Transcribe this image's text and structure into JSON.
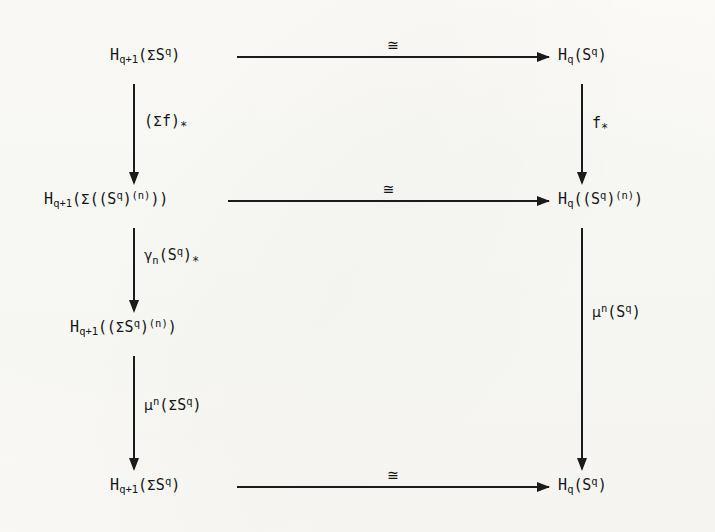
{
  "diagram": {
    "kind": "commutative-diagram",
    "title": "",
    "ink_color": "#1b1b1b",
    "paper_color": "#fbfaf7",
    "nodes": [
      {
        "id": "n-top-left",
        "name": "node-top-left",
        "text": "H_{q+1}(ΣS^q)",
        "base": "H",
        "subscript": "q+1",
        "argument": "(ΣS^q)",
        "row": 1,
        "col": "left"
      },
      {
        "id": "n-top-right",
        "name": "node-top-right",
        "text": "H_q(S^q)",
        "base": "H",
        "subscript": "q",
        "argument": "(S^q)",
        "row": 1,
        "col": "right"
      },
      {
        "id": "n-row2-left",
        "name": "node-row2-left",
        "text": "H_{q+1}(Σ((S^q)^(n)))",
        "base": "H",
        "subscript": "q+1",
        "argument": "(Σ((S^q)^(n)))",
        "row": 2,
        "col": "left"
      },
      {
        "id": "n-row2-right",
        "name": "node-row2-right",
        "text": "H_q((S^q)^(n))",
        "base": "H",
        "subscript": "q",
        "argument": "((S^q)^(n))",
        "row": 2,
        "col": "right"
      },
      {
        "id": "n-row3-left",
        "name": "node-row3-left",
        "text": "H_{q+1}((ΣS^q)^(n))",
        "base": "H",
        "subscript": "q+1",
        "argument": "((ΣS^q)^(n))",
        "row": 3,
        "col": "left"
      },
      {
        "id": "n-bottom-left",
        "name": "node-bottom-left",
        "text": "H_{q+1}(ΣS^q)",
        "base": "H",
        "subscript": "q+1",
        "argument": "(ΣS^q)",
        "row": 4,
        "col": "left"
      },
      {
        "id": "n-bottom-right",
        "name": "node-bottom-right",
        "text": "H_q(S^q)",
        "base": "H",
        "subscript": "q",
        "argument": "(S^q)",
        "row": 4,
        "col": "right"
      }
    ],
    "horizontal_arrows": [
      {
        "id": "h1",
        "name": "arrow-top-horizontal",
        "label": "≅",
        "from": "n-top-left",
        "to": "n-top-right",
        "direction": "right"
      },
      {
        "id": "h2",
        "name": "arrow-middle-horizontal",
        "label": "≅",
        "from": "n-row2-left",
        "to": "n-row2-right",
        "direction": "right"
      },
      {
        "id": "h3",
        "name": "arrow-bottom-horizontal",
        "label": "≅",
        "from": "n-bottom-left",
        "to": "n-bottom-right",
        "direction": "right"
      }
    ],
    "vertical_arrows": [
      {
        "id": "v-left-1",
        "name": "arrow-left-suspension-f",
        "label_plain": "(Σf)_*",
        "label_body": "(Σf)",
        "label_star": "*",
        "from": "n-top-left",
        "to": "n-row2-left",
        "direction": "down"
      },
      {
        "id": "v-left-2",
        "name": "arrow-left-gamma",
        "label_plain": "γ_n(S^q)_*",
        "label_greek": "γ",
        "label_sub": "n",
        "label_body": "(S^q)",
        "label_star": "*",
        "from": "n-row2-left",
        "to": "n-row3-left",
        "direction": "down"
      },
      {
        "id": "v-left-3",
        "name": "arrow-left-mu-suspension",
        "label_plain": "μ^n(ΣS^q)",
        "label_greek": "μ",
        "label_sup": "n",
        "label_body": "(ΣS^q)",
        "from": "n-row3-left",
        "to": "n-bottom-left",
        "direction": "down"
      },
      {
        "id": "v-right-1",
        "name": "arrow-right-f-star",
        "label_plain": "f_*",
        "label_body": "f",
        "label_star": "*",
        "from": "n-top-right",
        "to": "n-row2-right",
        "direction": "down"
      },
      {
        "id": "v-right-2",
        "name": "arrow-right-mu",
        "label_plain": "μ^n(S^q)",
        "label_greek": "μ",
        "label_sup": "n",
        "label_body": "(S^q)",
        "from": "n-row2-right",
        "to": "n-bottom-right",
        "direction": "down"
      }
    ],
    "symbols": {
      "iso": "≅",
      "sigma": "Σ",
      "gamma": "γ",
      "mu": "μ",
      "star": "*"
    }
  }
}
